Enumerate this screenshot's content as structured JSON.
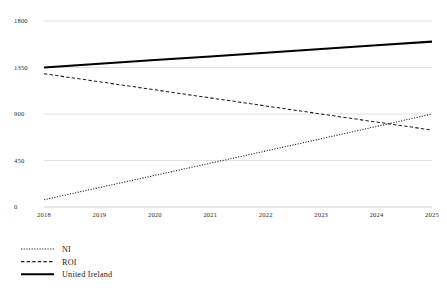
{
  "chart_data": {
    "type": "line",
    "title": "",
    "subtitle": "",
    "xlabel": "",
    "ylabel": "",
    "x": [
      2018,
      2019,
      2020,
      2021,
      2022,
      2023,
      2024,
      2025
    ],
    "xtick_labels": [
      "2018",
      "2019",
      "2020",
      "2021",
      "2022",
      "2023",
      "2024",
      "2025"
    ],
    "ytick_labels": [
      "0",
      "450",
      "900",
      "1350",
      "1800"
    ],
    "yticks": [
      0,
      450,
      900,
      1350,
      1800
    ],
    "ylim": [
      0,
      1800
    ],
    "xlim": [
      2018,
      2025
    ],
    "grid": true,
    "legend_position": "bottom-left",
    "series": [
      {
        "name": "NI",
        "style": "dotted",
        "color": "#1f1f1f",
        "values": [
          70,
          188,
          306,
          424,
          542,
          660,
          780,
          900
        ]
      },
      {
        "name": "ROI",
        "style": "dashed",
        "color": "#1f1f1f",
        "values": [
          1290,
          1212,
          1134,
          1056,
          978,
          900,
          822,
          745
        ]
      },
      {
        "name": "United Ireland",
        "style": "solid",
        "color": "#000000",
        "values": [
          1350,
          1386,
          1422,
          1457,
          1493,
          1529,
          1565,
          1600
        ]
      }
    ]
  },
  "legend": {
    "items": [
      {
        "label": "NI",
        "style": "dotted"
      },
      {
        "label": "ROI",
        "style": "dashed"
      },
      {
        "label": "United Ireland",
        "style": "solid"
      }
    ]
  }
}
